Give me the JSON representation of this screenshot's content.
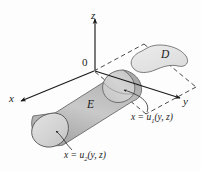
{
  "figure": {
    "kind": "3d-solid-region-diagram",
    "background_color": "#fdfdfd",
    "stroke_color": "#1a1a1a",
    "axes": {
      "z_label": "z",
      "x_label": "x",
      "y_label": "y",
      "origin_label": "0"
    },
    "regions": {
      "solid_label": "E",
      "projection_label": "D"
    },
    "surfaces": {
      "upper": {
        "prefix": "x = u",
        "index": "1",
        "args": "(y, z)"
      },
      "lower": {
        "prefix": "x = u",
        "index": "2",
        "args": "(y, z)"
      }
    },
    "colors": {
      "cylinder_light": "#e8e8e8",
      "cylinder_mid": "#bdbdbd",
      "cylinder_dark": "#9a9a9a",
      "cap_fill": "#d6d6d6",
      "projection_fill": "#e4e4e4",
      "dash_stroke": "#2a2a2a"
    }
  }
}
